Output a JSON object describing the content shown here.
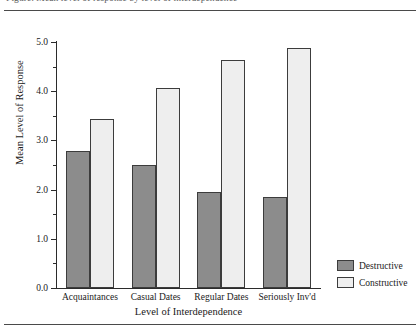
{
  "figure": {
    "clipped_caption": "Figure. Mean level of response by level of interdependence",
    "background": "#ffffff"
  },
  "chart_data": {
    "type": "bar",
    "title": "",
    "xlabel": "Level of Interdependence",
    "ylabel": "Mean Level of Response",
    "categories": [
      "Acquaintances",
      "Casual Dates",
      "Regular Dates",
      "Seriously Inv'd"
    ],
    "series": [
      {
        "name": "Destructive",
        "color": "#8c8c8c",
        "values": [
          2.78,
          2.5,
          1.96,
          1.86
        ]
      },
      {
        "name": "Constructive",
        "color": "#eeeeee",
        "values": [
          3.43,
          4.07,
          4.63,
          4.88
        ]
      }
    ],
    "ylim": [
      0.0,
      5.0
    ],
    "ytick_major": [
      "0.0",
      "1.0",
      "2.0",
      "3.0",
      "4.0",
      "5.0"
    ],
    "ytick_major_values": [
      0.0,
      1.0,
      2.0,
      3.0,
      4.0,
      5.0
    ],
    "ytick_minor_values": [
      0.5,
      1.5,
      2.5,
      3.5,
      4.5
    ],
    "grid": false,
    "legend_position": "right-bottom"
  },
  "legend": {
    "items": [
      {
        "label": "Destructive",
        "color": "#8c8c8c"
      },
      {
        "label": "Constructive",
        "color": "#eeeeee"
      }
    ]
  }
}
